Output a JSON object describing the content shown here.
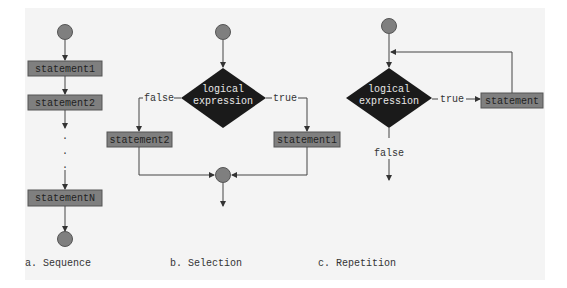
{
  "colors": {
    "background": "#ffffff",
    "panel": "#f4f4f4",
    "node_fill": "#7f7f7f",
    "node_stroke": "#555555",
    "diamond_fill": "#1a1a1a",
    "line": "#444444"
  },
  "sequence": {
    "caption": "a. Sequence",
    "statements": [
      "statement1",
      "statement2",
      "statementN"
    ],
    "ellipsis": ".",
    "start_node": "circle",
    "end_node": "circle"
  },
  "selection": {
    "caption": "b. Selection",
    "condition_line1": "logical",
    "condition_line2": "expression",
    "false_label": "false",
    "true_label": "true",
    "false_statement": "statement2",
    "true_statement": "statement1"
  },
  "repetition": {
    "caption": "c. Repetition",
    "condition_line1": "logical",
    "condition_line2": "expression",
    "true_label": "true",
    "false_label": "false",
    "statement": "statement"
  }
}
